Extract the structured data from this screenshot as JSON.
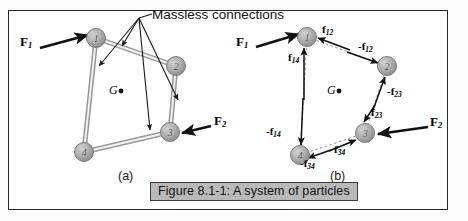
{
  "figure": {
    "caption": "Figure 8.1-1: A system of particles",
    "annotation": "Massless connections",
    "panel_a_label": "(a)",
    "panel_b_label": "(b)",
    "center_of_mass_symbol": "G"
  },
  "colors": {
    "node_fill": "#a8a8a8",
    "node_stroke": "#6e6e6e",
    "link": "#9a9a9a",
    "arrow": "#1a1a1a",
    "frame": "#2a2a2a",
    "caption_bg": "#b9b9b9"
  },
  "panel_a": {
    "label": "(a)",
    "nodes": [
      {
        "id": "1",
        "label": "1",
        "x": 96,
        "y": 38
      },
      {
        "id": "2",
        "label": "2",
        "x": 176,
        "y": 66
      },
      {
        "id": "3",
        "label": "3",
        "x": 170,
        "y": 132
      },
      {
        "id": "4",
        "label": "4",
        "x": 84,
        "y": 152
      }
    ],
    "center_of_mass": {
      "label": "G",
      "x": 112,
      "y": 90
    },
    "external_forces": [
      {
        "label": "F",
        "sub": "1",
        "x": 22,
        "y": 40
      },
      {
        "label": "F",
        "sub": "2",
        "x": 210,
        "y": 120
      }
    ],
    "connections": [
      {
        "from": "1",
        "to": "2"
      },
      {
        "from": "2",
        "to": "3"
      },
      {
        "from": "3",
        "to": "4"
      },
      {
        "from": "4",
        "to": "1"
      }
    ],
    "leader_label": "Massless connections"
  },
  "panel_b": {
    "label": "(b)",
    "nodes": [
      {
        "id": "1",
        "label": "1",
        "x": 307,
        "y": 37
      },
      {
        "id": "2",
        "label": "2",
        "x": 387,
        "y": 66
      },
      {
        "id": "3",
        "label": "3",
        "x": 365,
        "y": 133
      },
      {
        "id": "4",
        "label": "4",
        "x": 300,
        "y": 155
      }
    ],
    "center_of_mass": {
      "label": "G",
      "x": 329,
      "y": 90
    },
    "external_forces": [
      {
        "label": "F",
        "sub": "1",
        "x": 238,
        "y": 40
      },
      {
        "label": "F",
        "sub": "2",
        "x": 427,
        "y": 121
      }
    ],
    "internal_forces": [
      {
        "label": "f",
        "sub": "12",
        "sign": "",
        "x": 322,
        "y": 30
      },
      {
        "label": "f",
        "sub": "12",
        "sign": "-",
        "x": 362,
        "y": 46
      },
      {
        "label": "f",
        "sub": "14",
        "sign": "",
        "x": 294,
        "y": 58
      },
      {
        "label": "f",
        "sub": "14",
        "sign": "-",
        "x": 272,
        "y": 131
      },
      {
        "label": "f",
        "sub": "23",
        "sign": "-",
        "x": 390,
        "y": 92
      },
      {
        "label": "f",
        "sub": "23",
        "sign": "",
        "x": 373,
        "y": 113
      },
      {
        "label": "f",
        "sub": "34",
        "sign": "",
        "x": 336,
        "y": 150
      },
      {
        "label": "f",
        "sub": "34",
        "sign": "-",
        "x": 305,
        "y": 163
      }
    ]
  }
}
